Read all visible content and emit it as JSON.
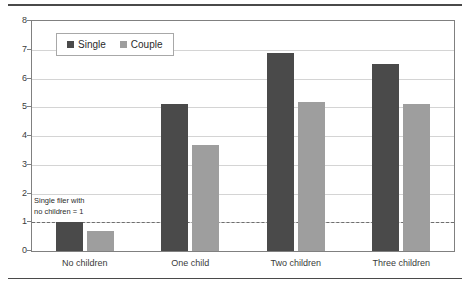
{
  "chart_data": {
    "type": "bar",
    "title": "",
    "xlabel": "",
    "ylabel": "",
    "ylim": [
      0,
      8
    ],
    "ytick_step": 1,
    "yticks": [
      "8",
      "7",
      "6",
      "5",
      "4",
      "3",
      "2",
      "1",
      "0"
    ],
    "grid": true,
    "legend_position": "top-left",
    "categories": [
      "No children",
      "One child",
      "Two children",
      "Three children"
    ],
    "series": [
      {
        "name": "Single",
        "color": "#4a4a4a",
        "values": [
          1.0,
          5.1,
          6.9,
          6.5
        ]
      },
      {
        "name": "Couple",
        "color": "#9e9e9e",
        "values": [
          0.7,
          3.7,
          5.2,
          5.1
        ]
      }
    ],
    "annotations": [
      {
        "text": "Single filer with\nno children = 1",
        "reference_line_value": 1.0,
        "reference_line_style": "dashed"
      }
    ]
  },
  "legend": {
    "items": [
      {
        "label": "Single",
        "color": "#4a4a4a"
      },
      {
        "label": "Couple",
        "color": "#9e9e9e"
      }
    ]
  }
}
